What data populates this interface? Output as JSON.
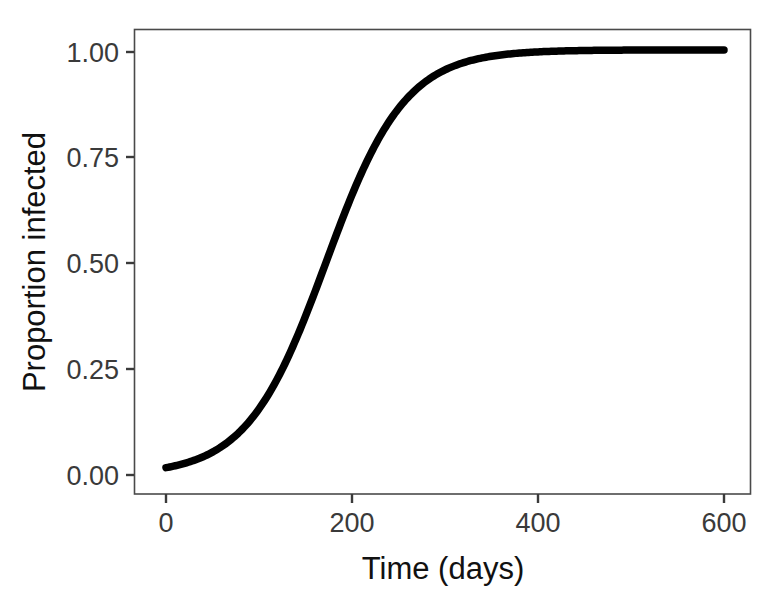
{
  "chart_data": {
    "type": "line",
    "title": "",
    "subtitle": "",
    "xlabel": "Time (days)",
    "ylabel": "Proportion infected",
    "xlim": [
      -18,
      625
    ],
    "ylim": [
      -0.03,
      1.055
    ],
    "xticks": [
      0,
      200,
      400,
      600
    ],
    "xtick_labels": [
      "0",
      "200",
      "400",
      "600"
    ],
    "yticks": [
      0.0,
      0.25,
      0.5,
      0.75,
      1.0
    ],
    "ytick_labels": [
      "0.00",
      "0.25",
      "0.50",
      "0.75",
      "1.00"
    ],
    "grid": false,
    "legend": null,
    "legend_position": "none",
    "annotations": [],
    "series": [
      {
        "name": "Proportion infected",
        "color": "#000000",
        "linewidth": 7.5,
        "model": "logistic",
        "model_params": {
          "L": 1.005,
          "k": 0.0235,
          "t0": 172
        },
        "x": [
          0,
          20,
          40,
          60,
          80,
          100,
          120,
          140,
          160,
          180,
          200,
          220,
          240,
          260,
          280,
          300,
          320,
          340,
          360,
          380,
          400,
          420,
          440,
          460,
          480,
          500,
          520,
          540,
          560,
          580,
          600
        ],
        "y": [
          0.018,
          0.028,
          0.044,
          0.069,
          0.106,
          0.159,
          0.232,
          0.325,
          0.434,
          0.548,
          0.656,
          0.747,
          0.819,
          0.873,
          0.911,
          0.939,
          0.958,
          0.971,
          0.98,
          0.986,
          0.99,
          0.993,
          0.996,
          0.997,
          0.998,
          0.999,
          1.0,
          1.0,
          1.001,
          1.001,
          1.001
        ]
      }
    ]
  },
  "axes": {
    "x_axis_title": "Time (days)",
    "y_axis_title": "Proportion infected",
    "x_tick_labels": [
      "0",
      "200",
      "400",
      "600"
    ],
    "y_tick_labels": [
      "1.00",
      "0.75",
      "0.50",
      "0.25",
      "0.00"
    ]
  },
  "colors": {
    "curve": "#000000",
    "frame": "#4a4a4a",
    "tick_text": "#3a3a3a",
    "title_text": "#111111",
    "background": "#ffffff"
  }
}
